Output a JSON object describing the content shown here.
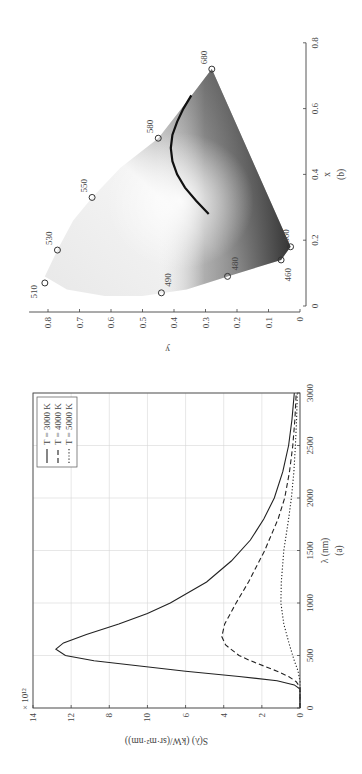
{
  "page_number": "",
  "chart_data": [
    {
      "id": "a",
      "type": "line",
      "caption": "(a)",
      "xlabel": "λ (nm)",
      "ylabel": "S(λ) (kW/(sr·m²·nm))",
      "y_multiplier": "× 10¹²",
      "xlim": [
        0,
        3000
      ],
      "ylim": [
        0,
        14
      ],
      "xticks": [
        0,
        500,
        1000,
        1500,
        2000,
        2500,
        3000
      ],
      "yticks": [
        {
          "label": "14",
          "pos": 14
        },
        {
          "label": "12",
          "pos": 12
        },
        {
          "label": "8",
          "pos": 10
        },
        {
          "label": "10",
          "pos": 8
        },
        {
          "label": "6",
          "pos": 6
        },
        {
          "label": "4",
          "pos": 4
        },
        {
          "label": "2",
          "pos": 2
        },
        {
          "label": "0",
          "pos": 0
        }
      ],
      "grid": true,
      "legend_position": "upper right",
      "series": [
        {
          "name": "T = 3000 K",
          "style": "solid",
          "x": [
            0,
            180,
            220,
            260,
            300,
            350,
            400,
            450,
            500,
            560,
            620,
            700,
            800,
            900,
            1000,
            1200,
            1400,
            1600,
            1800,
            2000,
            2250,
            2500,
            2750,
            3000
          ],
          "y": [
            0,
            0,
            0.3,
            1.2,
            3.2,
            6.0,
            8.4,
            10.8,
            12.3,
            12.8,
            12.4,
            11.2,
            9.5,
            8.0,
            6.8,
            4.9,
            3.6,
            2.6,
            1.9,
            1.35,
            0.9,
            0.6,
            0.42,
            0.3
          ]
        },
        {
          "name": "T = 4000 K",
          "style": "dashed",
          "x": [
            0,
            200,
            250,
            300,
            350,
            400,
            450,
            500,
            600,
            680,
            800,
            1000,
            1200,
            1500,
            1800,
            2000,
            2250,
            2500,
            2750,
            3000
          ],
          "y": [
            0,
            0,
            0.2,
            0.6,
            1.2,
            1.9,
            2.6,
            3.2,
            3.9,
            4.1,
            3.95,
            3.35,
            2.7,
            1.85,
            1.15,
            0.8,
            0.55,
            0.38,
            0.27,
            0.2
          ]
        },
        {
          "name": "T = 5000 K",
          "style": "dotted",
          "x": [
            0,
            250,
            350,
            450,
            600,
            800,
            1000,
            1200,
            1500,
            1800,
            2000,
            2250,
            2500,
            2750,
            3000
          ],
          "y": [
            0,
            0,
            0.1,
            0.3,
            0.55,
            0.85,
            1.0,
            0.98,
            0.85,
            0.6,
            0.45,
            0.32,
            0.24,
            0.18,
            0.14
          ]
        }
      ]
    },
    {
      "id": "b",
      "type": "scatter",
      "caption": "(b)",
      "xlabel": "x",
      "ylabel": "y",
      "xlim": [
        0,
        0.8
      ],
      "ylim": [
        0,
        0.8
      ],
      "xticks": [
        "0",
        "0.2",
        "0.4",
        "0.6",
        "0.8"
      ],
      "yticks": [
        "0",
        "0.1",
        "0.2",
        "0.3",
        "0.4",
        "0.5",
        "0.6",
        "0.7",
        "0.8"
      ],
      "grid": false,
      "markers": [
        {
          "label": "510",
          "x": 0.07,
          "y": 0.81
        },
        {
          "label": "530",
          "x": 0.17,
          "y": 0.77
        },
        {
          "label": "550",
          "x": 0.33,
          "y": 0.66
        },
        {
          "label": "580",
          "x": 0.51,
          "y": 0.45
        },
        {
          "label": "680",
          "x": 0.72,
          "y": 0.28
        },
        {
          "label": "490",
          "x": 0.04,
          "y": 0.44
        },
        {
          "label": "480",
          "x": 0.09,
          "y": 0.23
        },
        {
          "label": "460",
          "x": 0.14,
          "y": 0.06
        },
        {
          "label": "360",
          "x": 0.18,
          "y": 0.03
        }
      ],
      "planckian_locus": {
        "x": [
          0.28,
          0.32,
          0.36,
          0.4,
          0.44,
          0.48,
          0.52,
          0.56,
          0.6,
          0.64
        ],
        "y": [
          0.29,
          0.33,
          0.365,
          0.39,
          0.405,
          0.41,
          0.405,
          0.39,
          0.37,
          0.345
        ]
      },
      "gamut_outline": {
        "x": [
          0.18,
          0.14,
          0.09,
          0.05,
          0.03,
          0.03,
          0.05,
          0.09,
          0.17,
          0.26,
          0.33,
          0.42,
          0.51,
          0.62,
          0.72,
          0.18
        ],
        "y": [
          0.03,
          0.06,
          0.23,
          0.36,
          0.5,
          0.62,
          0.74,
          0.81,
          0.77,
          0.72,
          0.66,
          0.57,
          0.45,
          0.36,
          0.28,
          0.03
        ]
      }
    }
  ]
}
